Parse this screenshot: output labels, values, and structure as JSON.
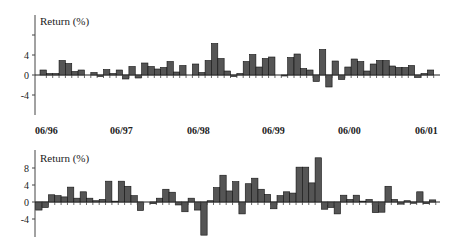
{
  "chart_data": [
    {
      "type": "bar",
      "title": "",
      "ylabel": "Return (%)",
      "xlabel": "",
      "ylim": [
        -8,
        12
      ],
      "yticks": [
        8,
        4,
        0,
        -4
      ],
      "ytick_labels": [
        "",
        "4",
        "0",
        "-4"
      ],
      "grid": false,
      "legend": null,
      "x_tick_labels": [
        "06/96",
        "06/97",
        "06/98",
        "06/99",
        "06/00",
        "06/01"
      ],
      "frequency": "monthly",
      "values": [
        1.0,
        0.3,
        0.3,
        2.9,
        2.3,
        0.7,
        1.0,
        0,
        0.5,
        -0.3,
        1.1,
        0.3,
        1.0,
        -0.8,
        1.7,
        -0.6,
        2.4,
        1.7,
        1.2,
        1.5,
        2.7,
        0.6,
        1.9,
        0,
        2.2,
        0.5,
        2.9,
        6.3,
        3.3,
        0.8,
        -0.3,
        0.3,
        2.7,
        4.1,
        1.6,
        3.3,
        3.6,
        0,
        -0.2,
        3.5,
        4.2,
        1.3,
        1.0,
        -1.3,
        5.1,
        -2.4,
        2.8,
        -0.9,
        1.6,
        3.2,
        2.7,
        0.8,
        2.2,
        2.9,
        2.9,
        1.8,
        1.5,
        1.5,
        1.9,
        -0.5,
        0.3,
        1.0
      ]
    },
    {
      "type": "bar",
      "title": "",
      "ylabel": "Return (%)",
      "xlabel": "",
      "ylim": [
        -8,
        12
      ],
      "yticks": [
        8,
        4,
        0,
        -4
      ],
      "ytick_labels": [
        "8",
        "4",
        "0",
        "-4"
      ],
      "grid": false,
      "legend": null,
      "frequency": "monthly",
      "values": [
        -1.9,
        -1.3,
        1.7,
        1.5,
        1.2,
        3.5,
        0.9,
        2.4,
        0.9,
        0.3,
        0.6,
        4.9,
        0.2,
        4.9,
        3.7,
        1.5,
        -2.0,
        0,
        -0.4,
        0.9,
        3.0,
        2.3,
        -0.7,
        -2.3,
        0.9,
        -1.9,
        -7.8,
        0.3,
        3.4,
        6.3,
        2.6,
        4.8,
        -2.8,
        4.3,
        5.6,
        3.0,
        1.8,
        -1.6,
        1.5,
        2.4,
        2.1,
        8.2,
        8.2,
        4.5,
        10.4,
        -1.7,
        -1.3,
        -2.8,
        1.6,
        0.6,
        1.6,
        0.2,
        0.6,
        -2.5,
        -2.4,
        3.7,
        0.6,
        -0.5,
        0.3,
        -0.3,
        2.4,
        -0.4,
        0.5
      ]
    }
  ],
  "colors": {
    "bar_fill": "#555555",
    "bar_stroke": "#111111",
    "axis": "#444444",
    "text": "#222222"
  },
  "top_panel": {
    "ylabel": "Return (%)",
    "ticks": [
      {
        "label": "",
        "y": 35
      },
      {
        "label": "4",
        "y": 55
      },
      {
        "label": "0",
        "y": 75
      },
      {
        "label": "-4",
        "y": 95
      }
    ]
  },
  "bottom_panel": {
    "ylabel": "Return (%)",
    "ticks": [
      {
        "label": "8",
        "y": 168
      },
      {
        "label": "4",
        "y": 185
      },
      {
        "label": "0",
        "y": 202
      },
      {
        "label": "-4",
        "y": 219
      }
    ]
  },
  "x_axis": {
    "dates": [
      {
        "label": "06/96",
        "x": 35
      },
      {
        "label": "06/97",
        "x": 110
      },
      {
        "label": "06/98",
        "x": 187
      },
      {
        "label": "06/99",
        "x": 262
      },
      {
        "label": "06/00",
        "x": 338
      },
      {
        "label": "06/01",
        "x": 415
      }
    ]
  }
}
